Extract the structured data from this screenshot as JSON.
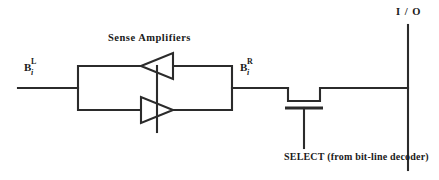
{
  "figure": {
    "type": "circuit-schematic",
    "title_visible": false,
    "background_color": "#ffffff",
    "line_color": "#2b2b2b",
    "width": 439,
    "height": 180
  },
  "labels": {
    "sense_amplifiers": "Sense  Amplifiers",
    "io": "I / O",
    "select": "SELECT (from bit-line decoder)",
    "bit_line_left": {
      "base": "B",
      "superscript": "L",
      "subscript": "i"
    },
    "bit_line_right": {
      "base": "B",
      "superscript": "R",
      "subscript": "i"
    }
  },
  "components": {
    "amplifier_top": {
      "name": "sense-amplifier-top",
      "direction": "left"
    },
    "amplifier_bottom": {
      "name": "sense-amplifier-bottom",
      "direction": "right"
    },
    "pass_transistor": {
      "name": "select-pass-transistor",
      "type": "nmos"
    },
    "coupling_box": {
      "name": "cross-coupled-amplifier-box"
    }
  },
  "nets": {
    "left_bit_line": "B_i^L",
    "right_bit_line": "B_i^R",
    "io_line": "I/O",
    "select_line": "SELECT"
  }
}
